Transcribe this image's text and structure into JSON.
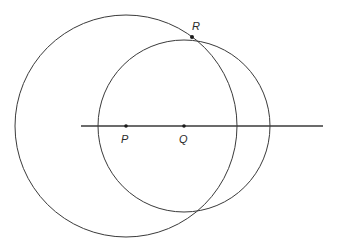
{
  "diagram": {
    "type": "geometric-construction",
    "line": {
      "x1": 81,
      "y1": 126,
      "x2": 323,
      "y2": 126,
      "width": 1.6
    },
    "points": [
      {
        "id": "P",
        "label": "P",
        "x": 126,
        "y": 126,
        "label_x": 121,
        "label_y": 143
      },
      {
        "id": "Q",
        "label": "Q",
        "x": 184,
        "y": 126,
        "label_x": 179,
        "label_y": 143
      },
      {
        "id": "R",
        "label": "R",
        "x": 192,
        "y": 37,
        "label_x": 192,
        "label_y": 30
      }
    ],
    "circles": [
      {
        "id": "circle-centered-P",
        "cx": 126,
        "cy": 126,
        "r": 111
      },
      {
        "id": "circle-centered-Q",
        "cx": 184,
        "cy": 126,
        "r": 86
      }
    ],
    "colors": {
      "stroke": "#3a3a3a",
      "background": "#ffffff",
      "point": "#1a1a1a"
    }
  }
}
